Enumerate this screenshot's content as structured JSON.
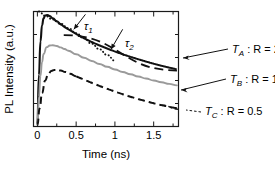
{
  "chart_data": {
    "type": "line",
    "title": "",
    "xlabel": "Time (ns)",
    "ylabel": "PL Intensity (a.u.)",
    "xlim": [
      -0.05,
      1.82
    ],
    "ylim": [
      0,
      1.0
    ],
    "xticks": [
      0,
      0.5,
      1,
      1.5
    ],
    "xticklabels": [
      "0",
      "0.5",
      "1",
      "1.5"
    ],
    "yticks": [],
    "yticklabels": [],
    "grid": false,
    "legend_position": "right-outside",
    "minor_xticks": [
      0.25,
      0.75,
      1.25,
      1.75
    ],
    "series": [
      {
        "name": "T_A: R=2",
        "label": "T",
        "label_sub": "A",
        "label_tail": " : R = 2",
        "style": "solid-noisy",
        "color": "#111111",
        "x": [
          0.0,
          0.02,
          0.04,
          0.06,
          0.08,
          0.1,
          0.13,
          0.16,
          0.2,
          0.25,
          0.3,
          0.35,
          0.4,
          0.45,
          0.5,
          0.6,
          0.7,
          0.8,
          0.9,
          1.0,
          1.1,
          1.2,
          1.3,
          1.4,
          1.5,
          1.6,
          1.7,
          1.8
        ],
        "y": [
          0.03,
          0.45,
          0.74,
          0.88,
          0.94,
          0.965,
          0.97,
          0.96,
          0.94,
          0.915,
          0.89,
          0.865,
          0.845,
          0.825,
          0.805,
          0.768,
          0.735,
          0.705,
          0.678,
          0.652,
          0.628,
          0.606,
          0.585,
          0.565,
          0.546,
          0.528,
          0.512,
          0.497
        ]
      },
      {
        "name": "T_B: R=1",
        "label": "T",
        "label_sub": "B",
        "label_tail": " : R = 1",
        "style": "solid-gray",
        "color": "#9a9a9a",
        "x": [
          0.0,
          0.02,
          0.04,
          0.06,
          0.08,
          0.12,
          0.16,
          0.2,
          0.25,
          0.3,
          0.35,
          0.4,
          0.5,
          0.6,
          0.7,
          0.8,
          0.9,
          1.0,
          1.1,
          1.2,
          1.3,
          1.4,
          1.5,
          1.6,
          1.7,
          1.8
        ],
        "y": [
          0.02,
          0.26,
          0.44,
          0.56,
          0.63,
          0.69,
          0.705,
          0.707,
          0.7,
          0.688,
          0.674,
          0.659,
          0.628,
          0.598,
          0.57,
          0.544,
          0.519,
          0.496,
          0.474,
          0.454,
          0.435,
          0.417,
          0.4,
          0.385,
          0.371,
          0.358
        ]
      },
      {
        "name": "T_C: R=0.5",
        "label": "T",
        "label_sub": "C",
        "label_tail": " : R = 0.5",
        "style": "dashed-noisy",
        "color": "#111111",
        "x": [
          0.0,
          0.03,
          0.06,
          0.1,
          0.14,
          0.18,
          0.22,
          0.26,
          0.3,
          0.36,
          0.42,
          0.5,
          0.6,
          0.7,
          0.8,
          0.9,
          1.0,
          1.1,
          1.2,
          1.3,
          1.4,
          1.5,
          1.6,
          1.7,
          1.8
        ],
        "y": [
          0.01,
          0.16,
          0.29,
          0.4,
          0.455,
          0.483,
          0.492,
          0.492,
          0.487,
          0.474,
          0.458,
          0.436,
          0.408,
          0.38,
          0.353,
          0.328,
          0.304,
          0.281,
          0.259,
          0.239,
          0.22,
          0.202,
          0.186,
          0.171,
          0.158
        ]
      }
    ],
    "fits": [
      {
        "name": "tau1-fit",
        "label": "τ",
        "label_sub": "1",
        "style": "dotted",
        "color": "#111111",
        "description": "fast-component exponential fit overlaying the T_A curve",
        "x": [
          0.02,
          0.1,
          0.2,
          0.3,
          0.4,
          0.5,
          0.6,
          0.7,
          0.8,
          0.9,
          1.0
        ],
        "y": [
          1.0,
          0.963,
          0.93,
          0.893,
          0.855,
          0.812,
          0.767,
          0.72,
          0.672,
          0.622,
          0.572
        ]
      },
      {
        "name": "tau2-fit",
        "label": "τ",
        "label_sub": "2",
        "style": "dashed",
        "color": "#111111",
        "description": "slow-component exponential fit, straight dashed line under the T_A curve",
        "x": [
          0.34,
          1.8
        ],
        "y": [
          0.795,
          0.487
        ]
      },
      {
        "name": "tauC-fit",
        "label": "",
        "label_sub": "",
        "style": "dashed-short",
        "color": "#111111",
        "description": "short dashed fit segment at the tail of the T_C curve near the legend",
        "x": [
          1.6,
          1.82
        ],
        "y": [
          0.186,
          0.15
        ]
      }
    ],
    "annotations": [
      {
        "name": "tau1-annotation",
        "text": "τ",
        "sub": "1",
        "arrow_from": [
          0.62,
          0.975
        ],
        "arrow_to": [
          0.47,
          0.845
        ]
      },
      {
        "name": "tau2-annotation",
        "text": "τ",
        "sub": "2",
        "arrow_from": [
          1.1,
          0.845
        ],
        "arrow_to": [
          0.95,
          0.672
        ]
      }
    ]
  },
  "axes": {
    "x_title": "Time (ns)",
    "y_title": "PL Intensity (a.u.)",
    "x_tick_labels": [
      "0",
      "0.5",
      "1",
      "1.5"
    ]
  },
  "legend": {
    "items": [
      {
        "symbol": "T",
        "subscript": "A",
        "tail": " : R = 2"
      },
      {
        "symbol": "T",
        "subscript": "B",
        "tail": " : R = 1"
      },
      {
        "symbol": "T",
        "subscript": "C",
        "tail": " : R = 0.5"
      }
    ]
  },
  "colors": {
    "curve_a": "#111111",
    "curve_b": "#9a9a9a",
    "curve_c": "#111111",
    "frame": "#1a1a1a",
    "background": "#ffffff"
  }
}
